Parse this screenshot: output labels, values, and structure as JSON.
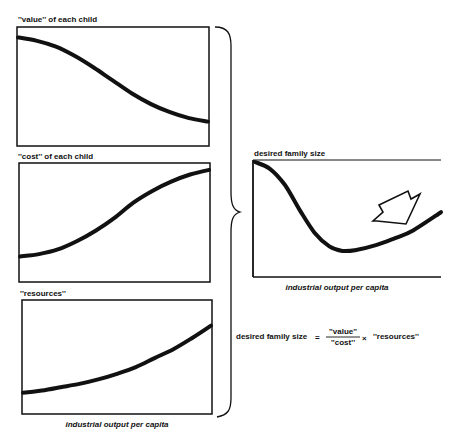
{
  "chart_data": [
    {
      "type": "line",
      "id": "value",
      "title": "''value'' of each child",
      "xlabel": "",
      "ylabel": "",
      "grid": false,
      "xlim": [
        0,
        1
      ],
      "ylim": [
        0,
        1
      ],
      "series": [
        {
          "name": "value",
          "x": [
            0,
            0.1,
            0.2,
            0.3,
            0.4,
            0.5,
            0.6,
            0.7,
            0.8,
            0.9,
            1.0
          ],
          "values": [
            0.92,
            0.89,
            0.84,
            0.76,
            0.66,
            0.55,
            0.44,
            0.35,
            0.28,
            0.23,
            0.2
          ]
        }
      ]
    },
    {
      "type": "line",
      "id": "cost",
      "title": "''cost'' of each child",
      "xlabel": "",
      "ylabel": "",
      "grid": false,
      "xlim": [
        0,
        1
      ],
      "ylim": [
        0,
        1
      ],
      "series": [
        {
          "name": "cost",
          "x": [
            0,
            0.1,
            0.2,
            0.3,
            0.4,
            0.5,
            0.6,
            0.7,
            0.8,
            0.9,
            1.0
          ],
          "values": [
            0.21,
            0.23,
            0.27,
            0.34,
            0.43,
            0.54,
            0.67,
            0.77,
            0.85,
            0.91,
            0.95
          ]
        }
      ]
    },
    {
      "type": "line",
      "id": "resources",
      "title": "''resources''",
      "xlabel": "industrial output per capita",
      "ylabel": "",
      "grid": false,
      "xlim": [
        0,
        1
      ],
      "ylim": [
        0,
        1
      ],
      "series": [
        {
          "name": "resources",
          "x": [
            0,
            0.1,
            0.2,
            0.3,
            0.4,
            0.5,
            0.6,
            0.7,
            0.8,
            0.9,
            1.0
          ],
          "values": [
            0.18,
            0.2,
            0.23,
            0.26,
            0.3,
            0.35,
            0.41,
            0.49,
            0.57,
            0.67,
            0.78
          ]
        }
      ]
    },
    {
      "type": "line",
      "id": "desired",
      "title": "desired family size",
      "xlabel": "industrial output per capita",
      "ylabel": "",
      "grid": false,
      "xlim": [
        0,
        1
      ],
      "ylim": [
        0,
        1
      ],
      "series": [
        {
          "name": "desired family size",
          "x": [
            0,
            0.08,
            0.16,
            0.24,
            0.32,
            0.4,
            0.47,
            0.55,
            0.65,
            0.75,
            0.85,
            1.0
          ],
          "values": [
            1.0,
            0.94,
            0.8,
            0.58,
            0.38,
            0.26,
            0.22,
            0.23,
            0.27,
            0.33,
            0.4,
            0.56
          ]
        }
      ]
    }
  ],
  "formula": {
    "lhs": "desired family size",
    "equals": "=",
    "numerator": "''value''",
    "denominator": "''cost''",
    "times": "×",
    "rhs": "''resources''"
  },
  "annotation": {
    "icon": "hollow-arrow-icon",
    "direction": "down-right"
  }
}
